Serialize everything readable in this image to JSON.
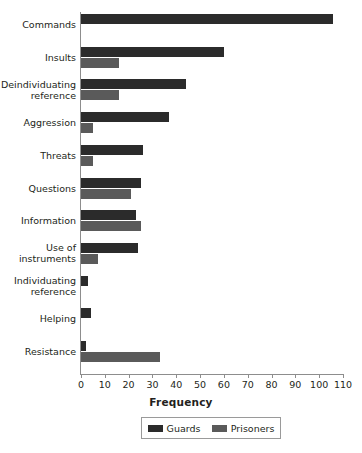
{
  "chart_data": {
    "type": "bar",
    "orientation": "horizontal",
    "title": "",
    "xlabel": "Frequency",
    "ylabel": "",
    "xlim": [
      0,
      110
    ],
    "xticks": [
      0,
      10,
      20,
      30,
      40,
      50,
      60,
      70,
      80,
      90,
      100,
      110
    ],
    "grid": false,
    "legend_position": "bottom",
    "categories": [
      "Commands",
      "Insults",
      "Deindividuating\nreference",
      "Aggression",
      "Threats",
      "Questions",
      "Information",
      "Use of\ninstruments",
      "Individuating\nreference",
      "Helping",
      "Resistance"
    ],
    "series": [
      {
        "name": "Guards",
        "color": "#2b2b2b",
        "values": [
          106,
          60,
          44,
          37,
          26,
          25,
          23,
          24,
          3,
          4,
          2
        ]
      },
      {
        "name": "Prisoners",
        "color": "#5a5a5a",
        "values": [
          0,
          16,
          16,
          5,
          5,
          21,
          25,
          7,
          0,
          0,
          33
        ]
      }
    ]
  },
  "legend": {
    "items": [
      {
        "label": "Guards",
        "swatch": "guards"
      },
      {
        "label": "Prisoners",
        "swatch": "prisoners"
      }
    ]
  },
  "colors": {
    "guards": "#2b2b2b",
    "prisoners": "#5a5a5a",
    "axis": "#8d8d8d",
    "text": "#231f20",
    "background": "#ffffff"
  }
}
